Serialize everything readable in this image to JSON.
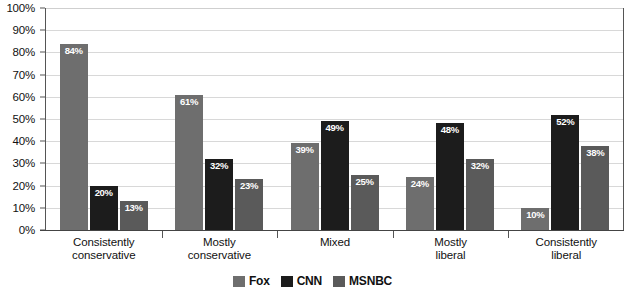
{
  "chart_data": {
    "type": "bar",
    "title": "",
    "subtitle": "",
    "xlabel": "",
    "ylabel": "",
    "ylim": [
      0,
      100
    ],
    "grid": true,
    "legend_position": "bottom-center",
    "categories": [
      "Consistently conservative",
      "Mostly conservative",
      "Mixed",
      "Mostly liberal",
      "Consistently liberal"
    ],
    "category_lines": [
      [
        "Consistently",
        "conservative"
      ],
      [
        "Mostly",
        "conservative"
      ],
      [
        "Mixed",
        ""
      ],
      [
        "Mostly",
        "liberal"
      ],
      [
        "Consistently",
        "liberal"
      ]
    ],
    "series": [
      {
        "name": "Fox",
        "color": "#6e6e6e",
        "values": [
          84,
          61,
          39,
          24,
          10
        ],
        "labels": [
          "84%",
          "61%",
          "39%",
          "24%",
          "10%"
        ]
      },
      {
        "name": "CNN",
        "color": "#1c1c1c",
        "values": [
          20,
          32,
          49,
          48,
          52
        ],
        "labels": [
          "20%",
          "32%",
          "49%",
          "48%",
          "52%"
        ]
      },
      {
        "name": "MSNBC",
        "color": "#5a5a5a",
        "values": [
          13,
          23,
          25,
          32,
          38
        ],
        "labels": [
          "13%",
          "23%",
          "25%",
          "32%",
          "38%"
        ]
      }
    ],
    "y_ticks": [
      "0%",
      "10%",
      "20%",
      "30%",
      "40%",
      "50%",
      "60%",
      "70%",
      "80%",
      "90%",
      "100%"
    ],
    "y_tick_values": [
      0,
      10,
      20,
      30,
      40,
      50,
      60,
      70,
      80,
      90,
      100
    ]
  },
  "legend": {
    "items": [
      {
        "label": "Fox",
        "color": "#6e6e6e"
      },
      {
        "label": "CNN",
        "color": "#1c1c1c"
      },
      {
        "label": "MSNBC",
        "color": "#5a5a5a"
      }
    ]
  }
}
